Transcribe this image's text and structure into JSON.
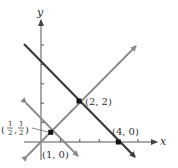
{
  "diagram": {
    "type": "coordinate-plane",
    "axes": {
      "x_label": "x",
      "y_label": "y",
      "origin_px": [
        41,
        142
      ],
      "unit_px": 19.4,
      "x_ticks": [
        1,
        2,
        3,
        4,
        5
      ],
      "y_ticks": [
        1,
        2,
        3,
        4,
        5
      ]
    },
    "lines": [
      {
        "name": "line-y-equals-neg-x-plus-4",
        "equation": "y = -x + 4",
        "color": "#3a3a3a",
        "width": 2.2
      },
      {
        "name": "line-y-equals-x",
        "equation": "y = x",
        "color": "#8a8a8a",
        "width": 1.8
      },
      {
        "name": "line-y-equals-neg-x-plus-1",
        "equation": "y = -x + 1",
        "color": "#8a8a8a",
        "width": 1.8
      }
    ],
    "points": [
      {
        "label": "(2, 2)",
        "x": 2,
        "y": 2
      },
      {
        "label": "(4, 0)",
        "x": 4,
        "y": 0
      },
      {
        "label_num": "1",
        "label_den": "2",
        "x": 0.5,
        "y": 0.5
      },
      {
        "label": "(1, 0)",
        "x": 1,
        "y": 0
      }
    ],
    "labels": {
      "point_2_2": "(2, 2)",
      "point_4_0": "(4, 0)",
      "point_1_0": "(1, 0)",
      "half_num": "1",
      "half_den": "2",
      "comma": ","
    }
  }
}
